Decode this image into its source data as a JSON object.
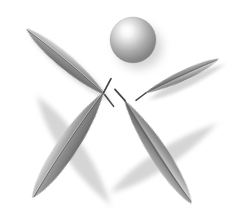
{
  "artwork": {
    "title": "Four-leaf and sphere emblem",
    "style": "grayscale-gradient",
    "background_color": "#ffffff",
    "canvas": {
      "width": 227,
      "height": 224
    },
    "palette": {
      "highlight": "#ffffff",
      "light_gray": "#e2e2e2",
      "mid_gray": "#9a9a9a",
      "base_gray": "#8a8a8a",
      "dark_gray": "#6e6e6e",
      "deep_gray": "#5a5a5a",
      "stem_color": "#4a4a4a",
      "shadow_color": "#b5b5b5"
    },
    "elements": [
      {
        "id": "sphere",
        "name": "sphere",
        "shape": "circle",
        "center": {
          "x": 133,
          "y": 40
        },
        "radius": 23,
        "highlight": {
          "x": 127,
          "y": 31
        },
        "shadow_offset": {
          "x": 5,
          "y": 6
        }
      },
      {
        "id": "leaf-upper-left",
        "name": "leaf-upper-left",
        "shape": "leaf",
        "length": 104,
        "width": 42,
        "rotation_deg": 40,
        "center": {
          "x": 66,
          "y": 62
        },
        "tip": {
          "x": 107,
          "y": 89
        },
        "stem_length": 14
      },
      {
        "id": "leaf-right",
        "name": "leaf-right",
        "shape": "leaf",
        "length": 82,
        "width": 30,
        "rotation_deg": -25,
        "center": {
          "x": 182,
          "y": 76
        },
        "tip": {
          "x": 148,
          "y": 92
        },
        "stem_length": 12
      },
      {
        "id": "leaf-lower-left",
        "name": "leaf-lower-left",
        "shape": "leaf",
        "length": 128,
        "width": 60,
        "rotation_deg": 56,
        "center": {
          "x": 68,
          "y": 145
        },
        "tip": {
          "x": 108,
          "y": 96
        },
        "stem_length": 16
      },
      {
        "id": "leaf-lower-right",
        "name": "leaf-lower-right",
        "shape": "leaf",
        "length": 124,
        "width": 54,
        "rotation_deg": -33,
        "center": {
          "x": 158,
          "y": 152
        },
        "tip": {
          "x": 131,
          "y": 104
        },
        "stem_length": 15
      }
    ]
  }
}
